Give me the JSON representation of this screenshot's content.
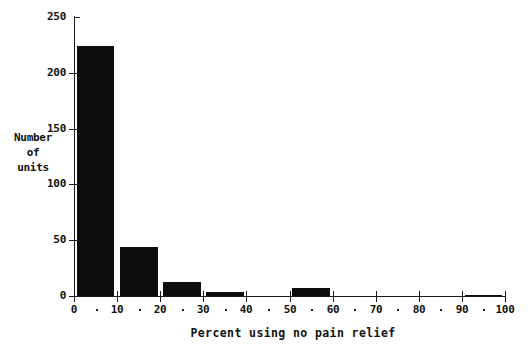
{
  "chart_data": {
    "type": "bar",
    "title": "",
    "xlabel": "Percent using no pain relief",
    "ylabel_lines": [
      "Number",
      "of",
      "units"
    ],
    "xlim": [
      0,
      100
    ],
    "ylim": [
      0,
      250
    ],
    "grid": false,
    "legend": null,
    "x_ticks": [
      0,
      10,
      20,
      30,
      40,
      50,
      60,
      70,
      80,
      90,
      100
    ],
    "x_tick_labels": [
      "0",
      "10",
      "20",
      "30",
      "40",
      "50",
      "60",
      "70",
      "80",
      "90",
      "100"
    ],
    "x_minor_ticks": [
      5,
      15,
      25,
      35,
      45,
      55,
      65,
      75,
      85,
      95
    ],
    "y_ticks": [
      0,
      50,
      100,
      150,
      200,
      250
    ],
    "y_tick_labels": [
      "0",
      "50",
      "100",
      "150",
      "200",
      "250"
    ],
    "bar_color": "#0d0d0d",
    "bin_width": 10,
    "categories": [
      "0-10",
      "10-20",
      "20-30",
      "30-40",
      "40-50",
      "50-60",
      "60-70",
      "70-80",
      "80-90",
      "90-100"
    ],
    "bins": [
      {
        "x0": 0,
        "x1": 10,
        "value": 224
      },
      {
        "x0": 10,
        "x1": 20,
        "value": 44
      },
      {
        "x0": 20,
        "x1": 30,
        "value": 13
      },
      {
        "x0": 30,
        "x1": 40,
        "value": 4
      },
      {
        "x0": 40,
        "x1": 50,
        "value": 0
      },
      {
        "x0": 50,
        "x1": 60,
        "value": 7
      },
      {
        "x0": 60,
        "x1": 70,
        "value": 0
      },
      {
        "x0": 70,
        "x1": 80,
        "value": 0
      },
      {
        "x0": 80,
        "x1": 90,
        "value": 0
      },
      {
        "x0": 90,
        "x1": 100,
        "value": 1
      }
    ],
    "values": [
      224,
      44,
      13,
      4,
      0,
      7,
      0,
      0,
      0,
      1
    ]
  }
}
